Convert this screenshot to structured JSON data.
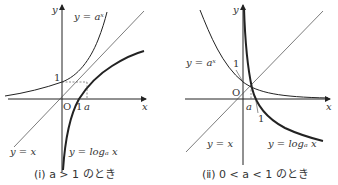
{
  "panels": [
    {
      "caption": "(ⅰ)  a > 1 のとき",
      "axis_x": "x",
      "axis_y": "y",
      "origin": "O",
      "tick_y": "1",
      "tick_x1": "1",
      "tick_xa": "a",
      "label_exp": "y = aˣ",
      "label_identity": "y = x",
      "label_log": "y = logₐ x"
    },
    {
      "caption": "(ⅱ)  0 < a < 1 のとき",
      "axis_x": "x",
      "axis_y": "y",
      "origin": "O",
      "tick_y": "1",
      "tick_x1": "1",
      "tick_xa": "a",
      "label_exp": "y = aˣ",
      "label_identity": "y = x",
      "label_log": "y = logₐ x"
    }
  ]
}
